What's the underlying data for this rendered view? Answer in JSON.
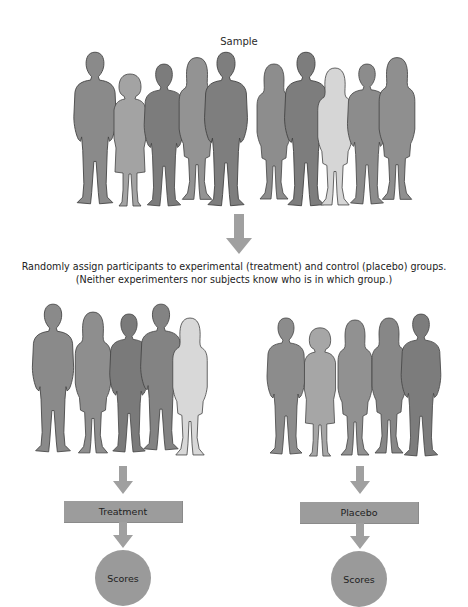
{
  "diagram": {
    "sample_label": "Sample",
    "assignment_caption": {
      "line1": "Randomly assign participants to experimental (treatment) and control (placebo) groups.",
      "line2": "(Neither experimenters nor subjects know who is in which group.)"
    },
    "groups": [
      {
        "name": "treatment",
        "box_label": "Treatment",
        "outcome_label": "Scores",
        "member_count": 5
      },
      {
        "name": "placebo",
        "box_label": "Placebo",
        "outcome_label": "Scores",
        "member_count": 5
      }
    ],
    "sample_member_count": 10,
    "colors": {
      "dark_figure": "#7b7b7b",
      "mid_figure": "#8d8d8d",
      "light_figure": "#a5a5a5",
      "pale_figure": "#d8d8d8",
      "arrow": "#9e9e9e",
      "box": "#9c9c9c",
      "outline": "#444444"
    }
  }
}
